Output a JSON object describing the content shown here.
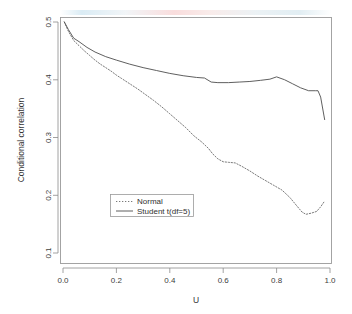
{
  "chart_data": {
    "type": "line",
    "title": "",
    "xlabel": "U",
    "ylabel": "Conditional correlation",
    "xlim": [
      -0.04,
      1.04
    ],
    "ylim": [
      0.082,
      0.515
    ],
    "xticks": [
      "0.0",
      "0.2",
      "0.4",
      "0.6",
      "0.8",
      "1.0"
    ],
    "xtick_values": [
      0.0,
      0.2,
      0.4,
      0.6,
      0.8,
      1.0
    ],
    "yticks": [
      "0.1",
      "0.2",
      "0.3",
      "0.4",
      "0.5"
    ],
    "ytick_values": [
      0.1,
      0.2,
      0.3,
      0.4,
      0.5
    ],
    "grid": false,
    "legend_position": "bottom-left-inside",
    "series": [
      {
        "name": "Normal",
        "style": "dashed",
        "color": "#6b6b6b",
        "x": [
          0.005,
          0.02,
          0.04,
          0.06,
          0.08,
          0.1,
          0.12,
          0.14,
          0.16,
          0.18,
          0.2,
          0.22,
          0.25,
          0.28,
          0.31,
          0.34,
          0.37,
          0.4,
          0.43,
          0.46,
          0.49,
          0.52,
          0.545,
          0.56,
          0.58,
          0.6,
          0.62,
          0.645,
          0.67,
          0.7,
          0.73,
          0.76,
          0.79,
          0.82,
          0.85,
          0.875,
          0.895,
          0.91,
          0.93,
          0.95,
          0.965,
          0.98
        ],
        "y": [
          0.5,
          0.484,
          0.468,
          0.459,
          0.45,
          0.442,
          0.434,
          0.427,
          0.421,
          0.415,
          0.408,
          0.402,
          0.393,
          0.384,
          0.374,
          0.364,
          0.353,
          0.341,
          0.329,
          0.317,
          0.303,
          0.292,
          0.281,
          0.272,
          0.263,
          0.258,
          0.257,
          0.256,
          0.25,
          0.242,
          0.233,
          0.225,
          0.217,
          0.209,
          0.196,
          0.182,
          0.171,
          0.167,
          0.169,
          0.172,
          0.18,
          0.19
        ]
      },
      {
        "name": "Student t(df=5)",
        "style": "solid",
        "color": "#4d4d4d",
        "x": [
          0.005,
          0.02,
          0.04,
          0.06,
          0.09,
          0.12,
          0.16,
          0.2,
          0.25,
          0.3,
          0.35,
          0.4,
          0.45,
          0.5,
          0.53,
          0.555,
          0.58,
          0.62,
          0.66,
          0.7,
          0.74,
          0.775,
          0.8,
          0.83,
          0.86,
          0.89,
          0.92,
          0.945,
          0.955,
          0.965,
          0.98
        ],
        "y": [
          0.5,
          0.487,
          0.472,
          0.466,
          0.456,
          0.448,
          0.44,
          0.434,
          0.427,
          0.421,
          0.416,
          0.411,
          0.407,
          0.404,
          0.403,
          0.396,
          0.395,
          0.395,
          0.396,
          0.397,
          0.399,
          0.401,
          0.405,
          0.4,
          0.393,
          0.386,
          0.381,
          0.381,
          0.381,
          0.37,
          0.331
        ]
      }
    ]
  },
  "legend": {
    "entries": [
      {
        "label": "Normal"
      },
      {
        "label": "Student t(df=5)"
      }
    ]
  }
}
